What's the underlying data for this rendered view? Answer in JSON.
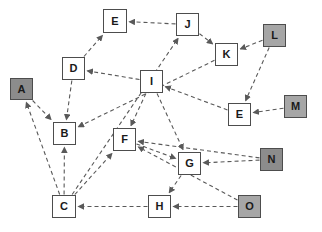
{
  "diagram": {
    "type": "directed-graph",
    "canvas": {
      "width": 322,
      "height": 232,
      "background": "#ffffff"
    },
    "colors": {
      "node_border": "#4d4d4d",
      "node_fill_white": "#ffffff",
      "node_fill_gray": "#a6a6a6",
      "node_fill_dark_gray": "#8c8c8c",
      "edge": "#595959",
      "label": "#1a1a1a"
    },
    "edge_style": "dashed-arrow",
    "nodes": [
      {
        "id": "A",
        "label": "A",
        "x": 10,
        "y": 78,
        "w": 23,
        "h": 22,
        "fill": "dark"
      },
      {
        "id": "B",
        "label": "B",
        "x": 53,
        "y": 122,
        "w": 23,
        "h": 23,
        "fill": "white"
      },
      {
        "id": "C",
        "label": "C",
        "x": 52,
        "y": 195,
        "w": 24,
        "h": 23,
        "fill": "white"
      },
      {
        "id": "D",
        "label": "D",
        "x": 62,
        "y": 57,
        "w": 23,
        "h": 23,
        "fill": "white"
      },
      {
        "id": "E1",
        "label": "E",
        "x": 103,
        "y": 9,
        "w": 24,
        "h": 24,
        "fill": "white"
      },
      {
        "id": "F",
        "label": "F",
        "x": 113,
        "y": 128,
        "w": 23,
        "h": 23,
        "fill": "white"
      },
      {
        "id": "G",
        "label": "G",
        "x": 178,
        "y": 152,
        "w": 23,
        "h": 23,
        "fill": "white"
      },
      {
        "id": "H",
        "label": "H",
        "x": 148,
        "y": 195,
        "w": 23,
        "h": 23,
        "fill": "white"
      },
      {
        "id": "I",
        "label": "I",
        "x": 140,
        "y": 70,
        "w": 23,
        "h": 23,
        "fill": "white"
      },
      {
        "id": "J",
        "label": "J",
        "x": 176,
        "y": 13,
        "w": 23,
        "h": 23,
        "fill": "white"
      },
      {
        "id": "K",
        "label": "K",
        "x": 215,
        "y": 43,
        "w": 23,
        "h": 23,
        "fill": "white"
      },
      {
        "id": "L",
        "label": "L",
        "x": 263,
        "y": 24,
        "w": 23,
        "h": 23,
        "fill": "gray"
      },
      {
        "id": "E2",
        "label": "E",
        "x": 228,
        "y": 103,
        "w": 23,
        "h": 23,
        "fill": "white"
      },
      {
        "id": "M",
        "label": "M",
        "x": 284,
        "y": 95,
        "w": 23,
        "h": 23,
        "fill": "gray"
      },
      {
        "id": "N",
        "label": "N",
        "x": 260,
        "y": 148,
        "w": 23,
        "h": 23,
        "fill": "dark"
      },
      {
        "id": "O",
        "label": "O",
        "x": 238,
        "y": 195,
        "w": 23,
        "h": 23,
        "fill": "gray"
      }
    ],
    "edges": [
      {
        "from": "J",
        "to": "E1",
        "name": "edge-j-e1"
      },
      {
        "from": "J",
        "to": "K",
        "name": "edge-j-k"
      },
      {
        "from": "L",
        "to": "K",
        "name": "edge-l-k"
      },
      {
        "from": "L",
        "to": "E2",
        "name": "edge-l-e2"
      },
      {
        "from": "M",
        "to": "E2",
        "name": "edge-m-e2"
      },
      {
        "from": "K",
        "to": "B",
        "name": "edge-k-b"
      },
      {
        "from": "E2",
        "to": "I",
        "name": "edge-e2-i"
      },
      {
        "from": "I",
        "to": "D",
        "name": "edge-i-d"
      },
      {
        "from": "I",
        "to": "F",
        "name": "edge-i-f"
      },
      {
        "from": "I",
        "to": "G",
        "name": "edge-i-g"
      },
      {
        "from": "D",
        "to": "E1",
        "name": "edge-d-e1"
      },
      {
        "from": "D",
        "to": "B",
        "name": "edge-d-b"
      },
      {
        "from": "A",
        "to": "B",
        "name": "edge-a-b"
      },
      {
        "from": "C",
        "to": "A",
        "name": "edge-c-a"
      },
      {
        "from": "C",
        "to": "B",
        "name": "edge-c-b"
      },
      {
        "from": "C",
        "to": "J",
        "name": "edge-c-j"
      },
      {
        "from": "C",
        "to": "F",
        "name": "edge-c-f"
      },
      {
        "from": "F",
        "to": "G",
        "name": "edge-f-g"
      },
      {
        "from": "N",
        "to": "G",
        "name": "edge-n-g"
      },
      {
        "from": "N",
        "to": "F",
        "name": "edge-n-f"
      },
      {
        "from": "O",
        "to": "F",
        "name": "edge-o-f"
      },
      {
        "from": "O",
        "to": "H",
        "name": "edge-o-h"
      },
      {
        "from": "G",
        "to": "H",
        "name": "edge-g-h"
      },
      {
        "from": "H",
        "to": "C",
        "name": "edge-h-c"
      }
    ]
  }
}
